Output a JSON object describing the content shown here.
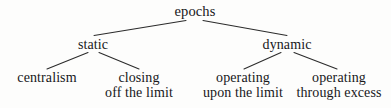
{
  "diagram": {
    "title_text": "epochs",
    "type": "tree",
    "background_color": "#fdfdfc",
    "text_color": "#17171a",
    "edge_color": "#2b2b2b",
    "root": {
      "label": "epochs"
    },
    "level2": [
      {
        "label": "static"
      },
      {
        "label": "dynamic"
      }
    ],
    "leaves": [
      {
        "line1": "centralism",
        "line2": ""
      },
      {
        "line1": "closing",
        "line2": "off the limit"
      },
      {
        "line1": "operating",
        "line2": "upon the limit"
      },
      {
        "line1": "operating",
        "line2": "through excess"
      }
    ],
    "edges": [
      {
        "from": "epochs",
        "to": "static"
      },
      {
        "from": "epochs",
        "to": "dynamic"
      },
      {
        "from": "static",
        "to": "centralism"
      },
      {
        "from": "static",
        "to": "closing off the limit"
      },
      {
        "from": "dynamic",
        "to": "operating upon the limit"
      },
      {
        "from": "dynamic",
        "to": "operating through excess"
      }
    ]
  }
}
